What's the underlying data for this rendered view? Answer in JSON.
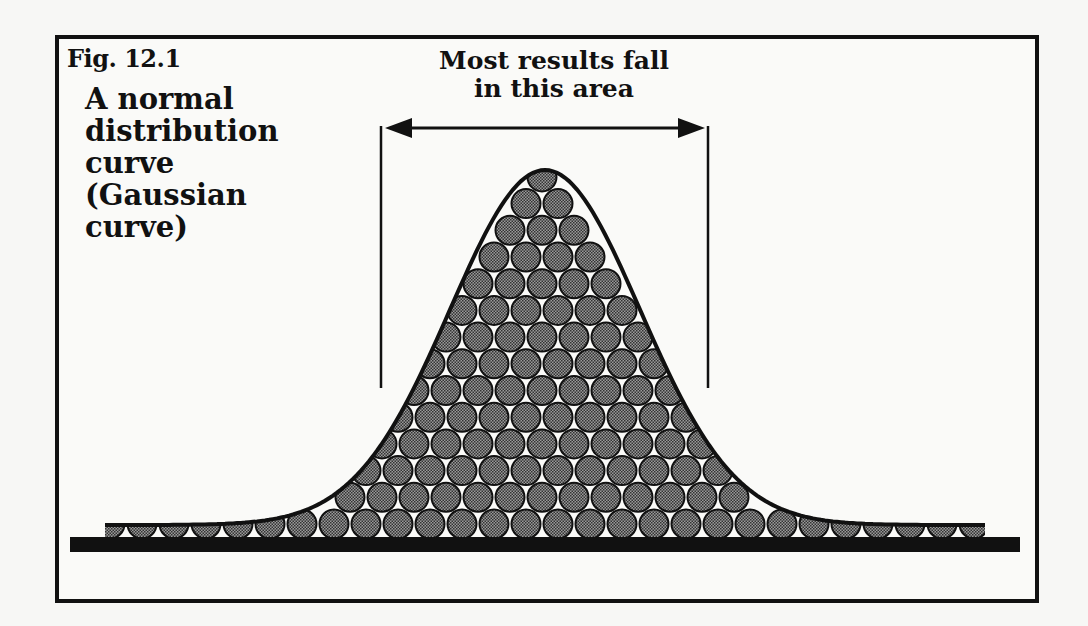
{
  "figure": {
    "label": "Fig. 12.1",
    "title_lines": [
      "A normal",
      "distribution",
      "curve",
      "(Gaussian",
      "curve)"
    ],
    "annotation_lines": [
      "Most results fall",
      "in this area"
    ]
  },
  "colors": {
    "ink": "#111111",
    "ball_fill": "#7a7a7a",
    "background": "#fafaf8"
  },
  "chart_data": {
    "type": "diagram",
    "title": "A normal distribution curve (Gaussian curve)",
    "figure_label": "Fig. 12.1",
    "annotations": [
      "Most results fall in this area"
    ],
    "curve": {
      "shape": "gaussian",
      "peak_x_px": 545,
      "peak_y_px": 170,
      "baseline_y_px": 537,
      "sigma_px": 95
    },
    "highlighted_region_px": {
      "left_x": 381,
      "right_x": 708
    },
    "ball_diameter_px": 30
  }
}
